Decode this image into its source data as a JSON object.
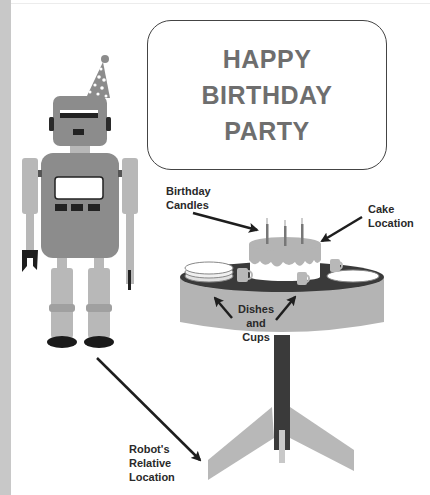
{
  "banner": {
    "lines": [
      "HAPPY",
      "BIRTHDAY",
      "PARTY"
    ]
  },
  "labels": {
    "birthday_candles": [
      "Birthday",
      "Candles"
    ],
    "cake_location": [
      "Cake",
      "Location"
    ],
    "dishes_and_cups": [
      "Dishes",
      "and",
      "Cups"
    ],
    "robot_relative_location": [
      "Robot's",
      "Relative",
      "Location"
    ]
  },
  "colors": {
    "robot_body": "#8c8c8c",
    "robot_limbs": "#b8b8b8",
    "table_top": "#3a3a3a",
    "table_side": "#b4b4b4",
    "cake_frosting": "#b4b4b4",
    "banner_text": "#6e6e6e",
    "arrow": "#1e1e1e"
  },
  "icons": {
    "robot": "robot-figure",
    "party_hat": "party-hat",
    "cake": "birthday-cake",
    "table": "round-table"
  }
}
